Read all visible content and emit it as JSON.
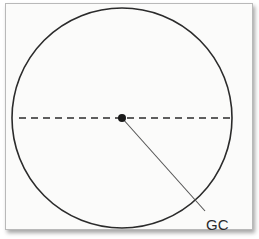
{
  "diagram": {
    "type": "circle-cross-section",
    "circle": {
      "cx": 122,
      "cy": 118,
      "r": 110,
      "stroke": "#2b2b2b"
    },
    "diameter_line": {
      "x1": 19,
      "x2": 230,
      "y": 118,
      "style": "dashed",
      "stroke": "#2b2b2b"
    },
    "center_point": {
      "cx": 122,
      "cy": 118,
      "r": 4,
      "fill": "#1a1a1a"
    },
    "leader_line": {
      "x1": 122,
      "y1": 118,
      "x2": 205,
      "y2": 211,
      "stroke": "#555555"
    },
    "label": {
      "text": "GC",
      "x": 206,
      "y": 230
    }
  }
}
